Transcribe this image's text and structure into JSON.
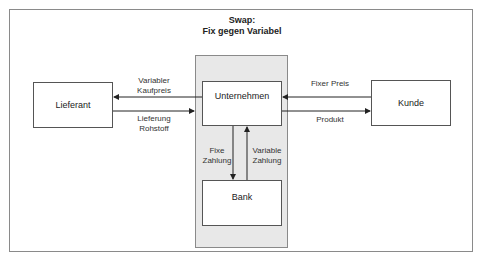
{
  "title": {
    "line1": "Swap:",
    "line2": "Fix gegen Variabel"
  },
  "nodes": {
    "supplier": "Lieferant",
    "company": "Unternehmen",
    "customer": "Kunde",
    "bank": "Bank"
  },
  "flows": {
    "supplier_in": {
      "line1": "Variabler",
      "line2": "Kaufpreis"
    },
    "supplier_out": {
      "line1": "Lieferung",
      "line2": "Rohstoff"
    },
    "customer_in": "Fixer Preis",
    "customer_out": "Produkt",
    "to_bank": {
      "line1": "Fixe",
      "line2": "Zahlung"
    },
    "from_bank": {
      "line1": "Variable",
      "line2": "Zahlung"
    }
  }
}
